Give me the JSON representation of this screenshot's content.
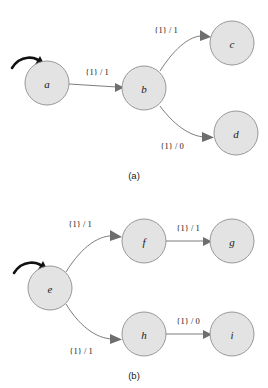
{
  "figure": {
    "background_color": "#ffffff",
    "node_fill": "#e3e3e3",
    "node_stroke": "#8d8d8d",
    "edge_color": "#6e6e6e",
    "start_arrow_color": "#111111"
  },
  "panels": [
    {
      "id": "a",
      "caption": "(a)",
      "nodes": [
        {
          "id": "a",
          "label": "a",
          "cx": 47,
          "cy": 83,
          "r": 22
        },
        {
          "id": "b",
          "label": "b",
          "cx": 144,
          "cy": 88,
          "r": 22
        },
        {
          "id": "c",
          "label": "c",
          "cx": 232,
          "cy": 43,
          "r": 22
        },
        {
          "id": "d",
          "label": "d",
          "cx": 236,
          "cy": 133,
          "r": 22
        }
      ],
      "start_node": "a",
      "edges": [
        {
          "from": "a",
          "to": "b",
          "label": "{1} / 1",
          "shape": "straight",
          "label_x": 97,
          "label_y": 72
        },
        {
          "from": "b",
          "to": "c",
          "label": "{1} / 1",
          "shape": "curve-up",
          "label_x": 166,
          "label_y": 30
        },
        {
          "from": "b",
          "to": "d",
          "label": "{1} / 0",
          "shape": "curve-down",
          "label_x": 172,
          "label_y": 146
        }
      ]
    },
    {
      "id": "b",
      "caption": "(b)",
      "nodes": [
        {
          "id": "e",
          "label": "e",
          "cx": 50,
          "cy": 94,
          "r": 22
        },
        {
          "id": "f",
          "label": "f",
          "cx": 144,
          "cy": 47,
          "r": 22
        },
        {
          "id": "g",
          "label": "g",
          "cx": 232,
          "cy": 47,
          "r": 22
        },
        {
          "id": "h",
          "label": "h",
          "cx": 144,
          "cy": 140,
          "r": 22
        },
        {
          "id": "i",
          "label": "i",
          "cx": 232,
          "cy": 140,
          "r": 22
        }
      ],
      "start_node": "e",
      "edges": [
        {
          "from": "e",
          "to": "f",
          "label": "{1} / 1",
          "shape": "curve-up",
          "label_x": 80,
          "label_y": 30
        },
        {
          "from": "f",
          "to": "g",
          "label": "{1} / 1",
          "shape": "straight",
          "label_x": 188,
          "label_y": 34
        },
        {
          "from": "e",
          "to": "h",
          "label": "{1} / 1",
          "shape": "curve-down",
          "label_x": 81,
          "label_y": 157
        },
        {
          "from": "h",
          "to": "i",
          "label": "{1} / 0",
          "shape": "straight",
          "label_x": 188,
          "label_y": 127
        }
      ]
    }
  ]
}
